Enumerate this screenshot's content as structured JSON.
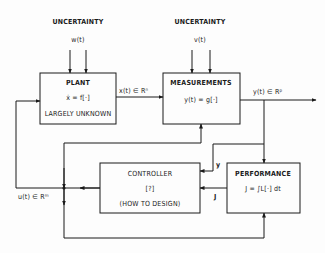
{
  "diagram": {
    "type": "block-diagram",
    "uncertainty_plant": {
      "title": "UNCERTAINTY",
      "signal": "w(t)"
    },
    "uncertainty_meas": {
      "title": "UNCERTAINTY",
      "signal": "v(t)"
    },
    "plant": {
      "title": "PLANT",
      "equation": "ẋ = f[·]",
      "note": "LARGELY UNKNOWN"
    },
    "measurements": {
      "title": "MEASUREMENTS",
      "equation": "y(t) = g[·]"
    },
    "controller": {
      "title": "CONTROLLER",
      "equation": "[?]",
      "note": "(HOW TO DESIGN)"
    },
    "performance": {
      "title": "PERFORMANCE",
      "equation": "J = ∫L[·] dt"
    },
    "signals": {
      "state": "x(t) ∈ Rⁿ",
      "output": "y(t) ∈ Rᵖ",
      "control": "u(t) ∈ Rᵐ",
      "y_feedback": "y",
      "j_feedback": "J"
    },
    "colors": {
      "line": "#1a1a1a",
      "background": "#fdfdfd"
    }
  }
}
